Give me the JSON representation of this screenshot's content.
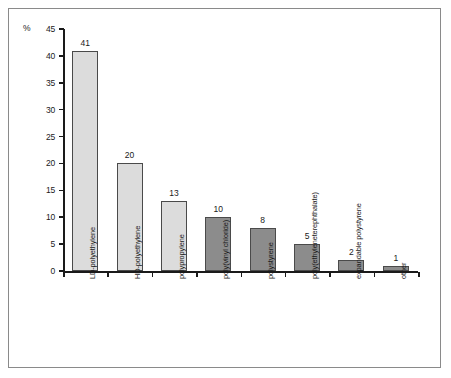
{
  "axis": {
    "unit_label": "%",
    "y_ticks": [
      0,
      5,
      10,
      15,
      20,
      25,
      30,
      35,
      40,
      45
    ]
  },
  "chart_data": {
    "type": "bar",
    "title": "",
    "xlabel": "",
    "ylabel": "%",
    "ylim": [
      0,
      45
    ],
    "grid": false,
    "legend": "none",
    "categories": [
      "LD-polyethylene",
      "HD-polyethylene",
      "polypropylene",
      "poly(vinyl chloride)",
      "polystyrene",
      "poly(ethyleneterephthalate)",
      "expandable polystyrene",
      "other"
    ],
    "values": [
      41,
      20,
      13,
      10,
      8,
      5,
      2,
      1
    ],
    "bar_colors": [
      "#dcdcdc",
      "#dcdcdc",
      "#dcdcdc",
      "#8c8c8c",
      "#8c8c8c",
      "#8c8c8c",
      "#8c8c8c",
      "#8c8c8c"
    ]
  },
  "colors": {
    "light_bar": "#dcdcdc",
    "dark_bar": "#8c8c8c",
    "axis": "#1a1a1a",
    "border": "#8a8a8a",
    "background": "#ffffff"
  }
}
